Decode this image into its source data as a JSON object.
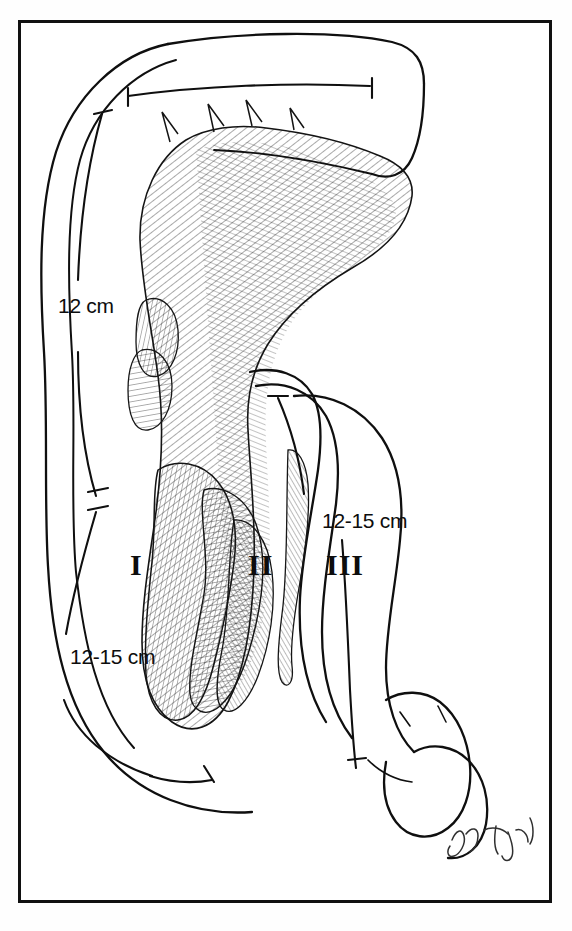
{
  "figure": {
    "domain": "anatomical-line-illustration",
    "medium": "pen-and-ink drawing",
    "background_color": "#ffffff",
    "ink_color": "#111111",
    "frame": {
      "present": true,
      "style": "rectangular black border",
      "color": "#111111",
      "left": 18,
      "top": 20,
      "width": 534,
      "height": 883,
      "border_width": 3
    },
    "measurements": [
      {
        "id": "superior-segment",
        "label": "12 cm",
        "position": "upper-left",
        "bracket": "curved-with-T-endcaps"
      },
      {
        "id": "descending-segment",
        "label": "12-15 cm",
        "position": "lower-left",
        "bracket": "curved-with-T-endcaps"
      },
      {
        "id": "horizontal-segment",
        "label": "12-15 cm",
        "position": "right",
        "bracket": "vertical-with-T-endcaps"
      }
    ],
    "part_labels": [
      {
        "id": "part-one",
        "label": "I",
        "description": "first part of duodenum"
      },
      {
        "id": "part-two",
        "label": "II",
        "description": "second part of duodenum"
      },
      {
        "id": "part-three",
        "label": "III",
        "description": "third part of duodenum"
      }
    ],
    "signature": {
      "present": true,
      "style": "cursive artist signature",
      "text": "Y. Tang"
    }
  }
}
